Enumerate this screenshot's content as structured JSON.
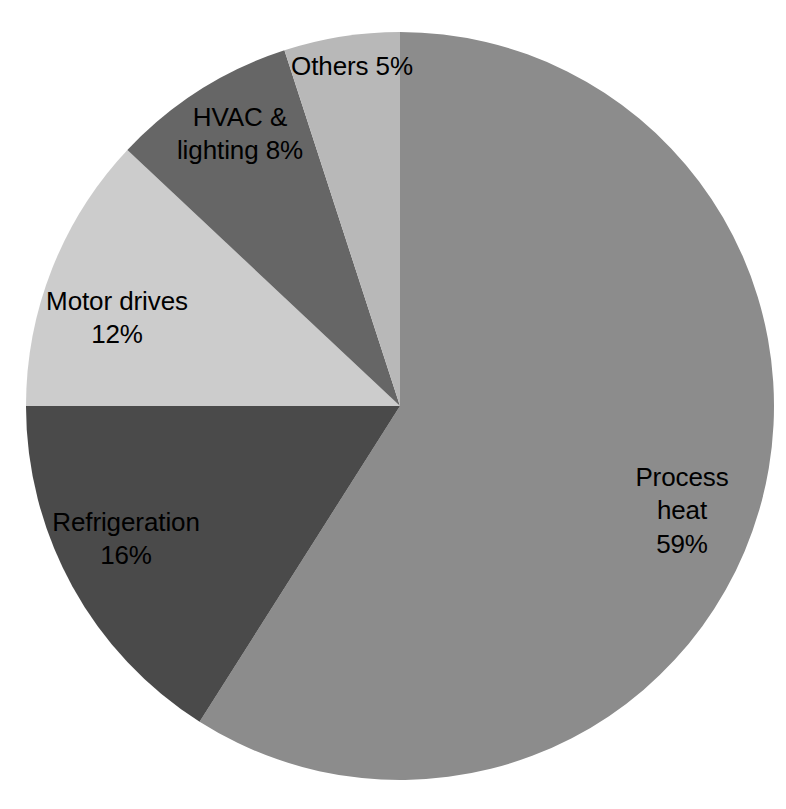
{
  "chart_data": {
    "type": "pie",
    "title": "",
    "subtitle": "",
    "xlabel": "",
    "ylabel": "",
    "grid": false,
    "legend": "none",
    "label_format": "{name} {value}%",
    "units": "percent",
    "total": 100,
    "start_angle_deg": 0,
    "direction": "clockwise",
    "categories": [
      "Process heat",
      "Refrigeration",
      "Motor drives",
      "HVAC & lighting",
      "Others"
    ],
    "values": [
      59,
      16,
      12,
      8,
      5
    ],
    "colors": [
      "#8c8c8c",
      "#4a4a4a",
      "#cccccc",
      "#666666",
      "#b8b8b8"
    ],
    "slices": [
      {
        "name": "Process heat",
        "value": 59,
        "label": "Process heat\n59%",
        "color": "#8c8c8c",
        "start_deg": 0,
        "sweep_deg": 212.4,
        "label_x": 682,
        "label_y": 511
      },
      {
        "name": "Refrigeration",
        "value": 16,
        "label": "Refrigeration\n16%",
        "color": "#4a4a4a",
        "start_deg": 212.4,
        "sweep_deg": 57.6,
        "label_x": 126,
        "label_y": 539
      },
      {
        "name": "Motor drives",
        "value": 12,
        "label": "Motor drives\n12%",
        "color": "#cccccc",
        "start_deg": 270.0,
        "sweep_deg": 43.2,
        "label_x": 117,
        "label_y": 318
      },
      {
        "name": "HVAC & lighting",
        "value": 8,
        "label": "HVAC &\nlighting 8%",
        "color": "#666666",
        "start_deg": 313.2,
        "sweep_deg": 28.8,
        "label_x": 240,
        "label_y": 134
      },
      {
        "name": "Others",
        "value": 5,
        "label": "Others 5%",
        "color": "#b8b8b8",
        "start_deg": 342.0,
        "sweep_deg": 18.0,
        "label_x": 352,
        "label_y": 67
      }
    ],
    "geometry": {
      "center_x": 400,
      "center_y": 406,
      "radius": 374
    },
    "background_color": "#ffffff",
    "label_color": "#000000"
  }
}
